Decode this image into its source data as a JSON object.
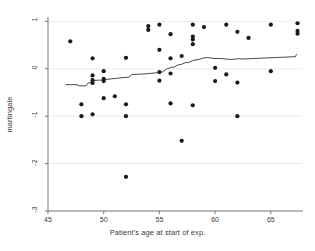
{
  "chart_data": {
    "type": "scatter",
    "title": "",
    "xlabel": "Patient's age at start of exp.",
    "ylabel": "martingale",
    "xlim": [
      45.0,
      67.8
    ],
    "ylim": [
      -3.0,
      1.05
    ],
    "xticks": [
      45,
      50,
      55,
      60,
      65
    ],
    "xticklabels": [
      "45",
      "50",
      "55",
      "60",
      "65"
    ],
    "yticks": [
      1,
      0,
      -1,
      -2,
      -3
    ],
    "yticklabels": [
      "1",
      "0",
      "-1",
      "-2",
      "-3"
    ],
    "grid": "horizontal",
    "legend": "none",
    "marker": {
      "shape": "circle",
      "color": "#1a1a1a",
      "size": 2.1
    },
    "series": [
      {
        "name": "martingale residuals",
        "type": "scatter",
        "points": [
          [
            47.0,
            0.58
          ],
          [
            48.0,
            -0.75
          ],
          [
            48.0,
            -1.0
          ],
          [
            49.0,
            0.22
          ],
          [
            49.0,
            -0.14
          ],
          [
            49.0,
            -0.24
          ],
          [
            49.0,
            -0.3
          ],
          [
            49.0,
            -0.96
          ],
          [
            50.0,
            -0.05
          ],
          [
            50.0,
            -0.21
          ],
          [
            50.0,
            -0.26
          ],
          [
            50.0,
            -0.62
          ],
          [
            51.0,
            -0.58
          ],
          [
            52.0,
            0.23
          ],
          [
            52.0,
            -0.75
          ],
          [
            52.0,
            -1.0
          ],
          [
            52.0,
            -2.28
          ],
          [
            54.0,
            0.82
          ],
          [
            54.0,
            0.9
          ],
          [
            55.0,
            0.93
          ],
          [
            55.0,
            0.4
          ],
          [
            55.0,
            -0.07
          ],
          [
            55.0,
            -0.25
          ],
          [
            56.0,
            0.73
          ],
          [
            56.0,
            0.22
          ],
          [
            56.0,
            -0.1
          ],
          [
            56.0,
            -0.73
          ],
          [
            57.0,
            0.27
          ],
          [
            57.0,
            -1.52
          ],
          [
            58.0,
            0.93
          ],
          [
            58.0,
            0.68
          ],
          [
            58.0,
            0.62
          ],
          [
            58.0,
            0.52
          ],
          [
            58.0,
            -0.77
          ],
          [
            59.0,
            0.88
          ],
          [
            60.0,
            0.02
          ],
          [
            60.0,
            -0.26
          ],
          [
            61.0,
            0.93
          ],
          [
            61.0,
            -0.12
          ],
          [
            62.0,
            0.78
          ],
          [
            62.0,
            -0.29
          ],
          [
            62.0,
            -1.0
          ],
          [
            63.0,
            0.65
          ],
          [
            65.0,
            0.93
          ],
          [
            65.0,
            -0.05
          ],
          [
            67.4,
            0.96
          ],
          [
            67.4,
            0.8
          ],
          [
            67.4,
            0.74
          ]
        ]
      },
      {
        "name": "smoothed trend",
        "type": "line",
        "color": "#1a1a1a",
        "width": 0.8,
        "points": [
          [
            46.6,
            -0.335
          ],
          [
            47.6,
            -0.335
          ],
          [
            47.8,
            -0.36
          ],
          [
            48.4,
            -0.36
          ],
          [
            48.6,
            -0.3
          ],
          [
            48.9,
            -0.29
          ],
          [
            49.1,
            -0.245
          ],
          [
            49.6,
            -0.24
          ],
          [
            49.9,
            -0.24
          ],
          [
            50.2,
            -0.225
          ],
          [
            51.4,
            -0.195
          ],
          [
            52.3,
            -0.175
          ],
          [
            52.5,
            -0.12
          ],
          [
            53.6,
            -0.11
          ],
          [
            54.3,
            -0.095
          ],
          [
            54.9,
            -0.08
          ],
          [
            55.3,
            -0.065
          ],
          [
            55.6,
            -0.01
          ],
          [
            56.1,
            0.035
          ],
          [
            56.3,
            0.03
          ],
          [
            56.6,
            0.075
          ],
          [
            57.0,
            0.095
          ],
          [
            57.4,
            0.135
          ],
          [
            57.6,
            0.13
          ],
          [
            58.0,
            0.175
          ],
          [
            58.6,
            0.2
          ],
          [
            59.0,
            0.23
          ],
          [
            59.4,
            0.235
          ],
          [
            59.9,
            0.218
          ],
          [
            60.6,
            0.215
          ],
          [
            61.2,
            0.2
          ],
          [
            61.6,
            0.198
          ],
          [
            62.1,
            0.215
          ],
          [
            62.4,
            0.205
          ],
          [
            63.0,
            0.212
          ],
          [
            64.0,
            0.222
          ],
          [
            65.2,
            0.235
          ],
          [
            66.5,
            0.248
          ],
          [
            67.2,
            0.255
          ],
          [
            67.3,
            0.3
          ]
        ]
      }
    ]
  },
  "style": {
    "figure_background": "#ffffff",
    "plot_background": "#ffffff",
    "grid_color": "#e2e2e2",
    "axis_color": "#5a5a5a",
    "text_color": "#3b3b3b",
    "marker_color": "#1a1a1a",
    "line_color": "#1a1a1a"
  }
}
